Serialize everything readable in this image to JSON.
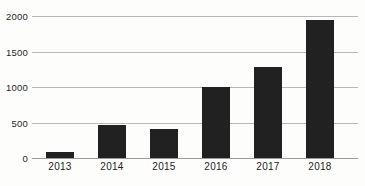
{
  "chart_data": {
    "type": "bar",
    "title": "",
    "subtitle": "",
    "xlabel": "",
    "ylabel": "",
    "categories": [
      "2013",
      "2014",
      "2015",
      "2016",
      "2017",
      "2018"
    ],
    "values": [
      85,
      465,
      410,
      1000,
      1285,
      1940
    ],
    "series": [
      {
        "name": "",
        "values": [
          85,
          465,
          410,
          1000,
          1285,
          1940
        ]
      }
    ],
    "ylim": [
      0,
      2000
    ],
    "ytick_labels": [
      "0",
      "500",
      "1000",
      "1500",
      "2000"
    ],
    "ytick_values": [
      0,
      500,
      1000,
      1500,
      2000
    ],
    "grid": true,
    "legend": false,
    "legend_position": "none",
    "bar_color": "#212121",
    "gridline_color": "#b7b7b7",
    "background_color": "#fdfdfc",
    "annotations": []
  },
  "figure": {
    "caption_remnant": "",
    "background_color": "#fdfdfc"
  }
}
